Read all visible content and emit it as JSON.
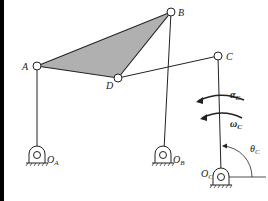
{
  "diagram": {
    "type": "four-bar linkage with coupler triangle",
    "colors": {
      "line": "#222222",
      "fill": "#b0b0b0",
      "border": "#000000"
    },
    "joints": {
      "A": {
        "label": "A",
        "x": 37,
        "y": 66
      },
      "B": {
        "label": "B",
        "x": 171,
        "y": 12
      },
      "C": {
        "label": "C",
        "x": 218,
        "y": 56
      },
      "D": {
        "label": "D",
        "x": 118,
        "y": 78
      }
    },
    "pivots": {
      "OA": {
        "label": "O",
        "sub": "A",
        "x": 37,
        "y": 155
      },
      "OB": {
        "label": "O",
        "sub": "B",
        "x": 163,
        "y": 155
      },
      "OC": {
        "label": "O",
        "sub": "C",
        "x": 221,
        "y": 177
      }
    },
    "annotations": {
      "alpha": {
        "label": "α",
        "sub": "C"
      },
      "omega": {
        "label": "ω",
        "sub": "C"
      },
      "theta": {
        "label": "θ",
        "sub": "C"
      }
    }
  }
}
